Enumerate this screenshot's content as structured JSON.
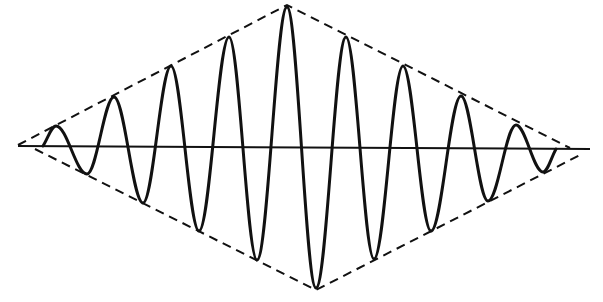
{
  "figure": {
    "colors": {
      "background": "#ffffff",
      "ink": "#111111"
    },
    "axis": {
      "x1": 18,
      "y1": 146,
      "x2": 590,
      "y2": 149
    },
    "envelope": {
      "style": "dashed",
      "left_apex": [
        18,
        145
      ],
      "top_apex": [
        287,
        5
      ],
      "right_apex_upper": [
        570,
        148
      ],
      "lower_left_start": [
        35,
        149
      ],
      "bottom_apex": [
        316,
        290
      ],
      "right_apex_lower": [
        580,
        155
      ]
    },
    "wave": {
      "start": [
        43,
        146
      ],
      "end": [
        556,
        149
      ],
      "peaks": [
        [
          56,
          126
        ],
        [
          114,
          97
        ],
        [
          171,
          66
        ],
        [
          229,
          37
        ],
        [
          287,
          7
        ],
        [
          346,
          37
        ],
        [
          403,
          66
        ],
        [
          461,
          96
        ],
        [
          516,
          125
        ]
      ],
      "troughs": [
        [
          87,
          174
        ],
        [
          143,
          203
        ],
        [
          199,
          231
        ],
        [
          257,
          260
        ],
        [
          316,
          288
        ],
        [
          374,
          259
        ],
        [
          431,
          231
        ],
        [
          488,
          201
        ],
        [
          543,
          172
        ]
      ]
    }
  }
}
